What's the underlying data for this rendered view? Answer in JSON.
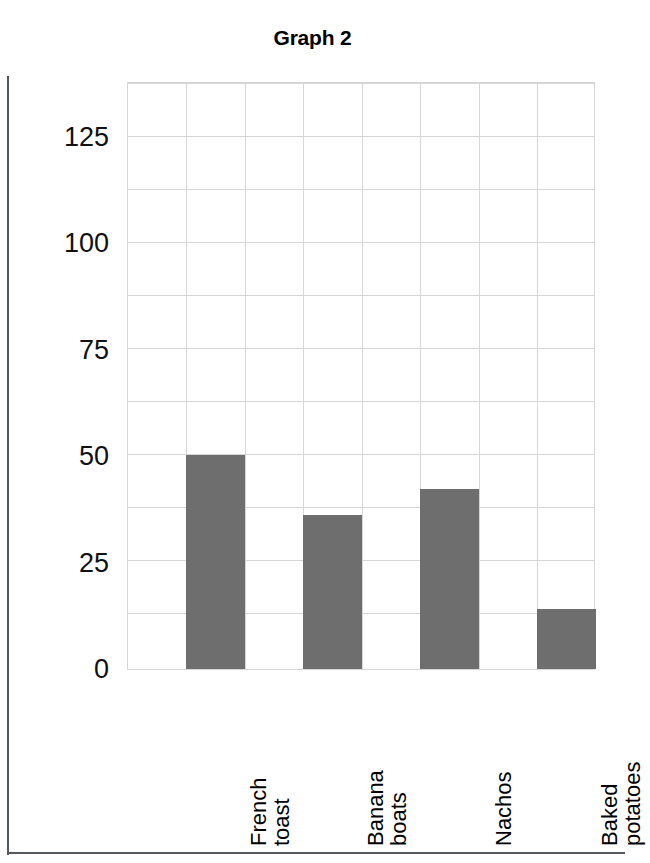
{
  "title": "Graph 2",
  "colors": {
    "bar": "#6E6E6E",
    "grid": "#D6D6D6",
    "frame": "#555A5E",
    "text": "#000000"
  },
  "y_axis": {
    "ticks": [
      {
        "label": "125",
        "value": 125
      },
      {
        "label": "100",
        "value": 100
      },
      {
        "label": "75",
        "value": 75
      },
      {
        "label": "50",
        "value": 50
      },
      {
        "label": "25",
        "value": 25
      },
      {
        "label": "0",
        "value": 0
      }
    ],
    "minor_step": 12.5
  },
  "x_axis": {
    "categories": [
      {
        "lines": [
          "French",
          "toast"
        ]
      },
      {
        "lines": [
          "Banana",
          "boats"
        ]
      },
      {
        "lines": [
          "Nachos"
        ]
      },
      {
        "lines": [
          "Baked",
          "potatoes"
        ]
      }
    ]
  },
  "chart_data": {
    "type": "bar",
    "title": "Graph 2",
    "xlabel": "",
    "ylabel": "",
    "categories": [
      "French toast",
      "Banana boats",
      "Nachos",
      "Baked potatoes"
    ],
    "values": [
      50,
      36,
      42,
      14
    ],
    "ylim": [
      0,
      137.5
    ],
    "yticks": [
      0,
      25,
      50,
      75,
      100,
      125
    ],
    "minor_gridline_step": 12.5,
    "grid": "both",
    "legend": "none",
    "bar_color": "#6E6E6E",
    "orientation": "vertical",
    "xtick_rotation": 90
  }
}
